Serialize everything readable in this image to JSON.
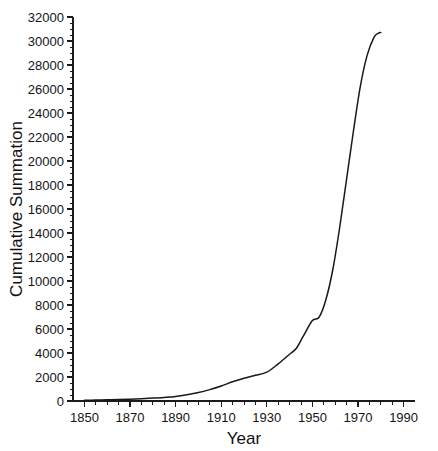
{
  "chart_data": {
    "type": "line",
    "title": "",
    "xlabel": "Year",
    "ylabel": "Cumulative Summation",
    "xlim": [
      1845,
      1995
    ],
    "ylim": [
      0,
      32000
    ],
    "grid": false,
    "legend": null,
    "x_ticks": [
      1850,
      1870,
      1890,
      1910,
      1930,
      1950,
      1970,
      1990
    ],
    "x_tick_labels": [
      "1850",
      "1870",
      "1890",
      "1910",
      "1930",
      "1950",
      "1970",
      "1990"
    ],
    "x_minor_step": 5,
    "y_ticks": [
      0,
      2000,
      4000,
      6000,
      8000,
      10000,
      12000,
      14000,
      16000,
      18000,
      20000,
      22000,
      24000,
      26000,
      28000,
      30000,
      32000
    ],
    "y_tick_labels": [
      "0",
      "2000",
      "4000",
      "6000",
      "8000",
      "10000",
      "12000",
      "14000",
      "16000",
      "18000",
      "20000",
      "22000",
      "24000",
      "26000",
      "28000",
      "30000",
      "32000"
    ],
    "y_minor_step": 500,
    "series": [
      {
        "name": "Cumulative Summation",
        "color": "#181818",
        "x": [
          1850,
          1855,
          1860,
          1865,
          1870,
          1875,
          1880,
          1885,
          1890,
          1895,
          1900,
          1905,
          1910,
          1915,
          1920,
          1925,
          1930,
          1935,
          1940,
          1943,
          1946,
          1950,
          1953,
          1956,
          1959,
          1962,
          1965,
          1968,
          1971,
          1974,
          1977,
          1979,
          1980
        ],
        "y": [
          60,
          80,
          100,
          120,
          150,
          190,
          240,
          300,
          380,
          520,
          700,
          950,
          1250,
          1600,
          1900,
          2150,
          2400,
          3100,
          3900,
          4400,
          5400,
          6700,
          7000,
          8500,
          11000,
          14500,
          18500,
          22500,
          26200,
          28800,
          30300,
          30650,
          30700
        ]
      }
    ]
  },
  "axes": {
    "x_axis_name": "year-axis",
    "y_axis_name": "cumulative-summation-axis"
  },
  "figure": {
    "background_color": "#ffffff",
    "line_color": "#181818",
    "axis_color": "#1c1c1c"
  }
}
